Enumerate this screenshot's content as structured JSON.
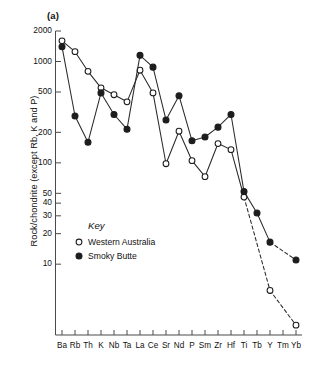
{
  "figure": {
    "panel_label": "(a)",
    "ylabel": "Rock/chondrite (except Rb, K and P)"
  },
  "legend": {
    "title": "Key",
    "entries": [
      {
        "label": "Western Australia",
        "marker": "open-circle-marker"
      },
      {
        "label": "Smoky Butte",
        "marker": "filled-circle-marker"
      }
    ]
  },
  "chart_data": {
    "type": "line",
    "title": "",
    "subtitle": "",
    "panel": "(a)",
    "xlabel": "",
    "ylabel": "Rock/chondrite (except Rb, K and P)",
    "yscale": "log",
    "ylim": [
      2.0,
      2000
    ],
    "grid": false,
    "legend_position": "inside-left",
    "ytick_labels": [
      "2000",
      "1000",
      "500",
      "200",
      "100",
      "50",
      "40",
      "30",
      "20",
      "10"
    ],
    "ytick_values": [
      2000,
      1000,
      500,
      200,
      100,
      50,
      40,
      30,
      20,
      10
    ],
    "categories": [
      "Ba",
      "Rb",
      "Th",
      "K",
      "Nb",
      "Ta",
      "La",
      "Ce",
      "Sr",
      "Nd",
      "P",
      "Sm",
      "Zr",
      "Hf",
      "Ti",
      "Tb",
      "Y",
      "Tm",
      "Yb"
    ],
    "series": [
      {
        "name": "Western Australia",
        "marker": "open-circle",
        "color": "#1d1d1d",
        "values": [
          1600,
          1250,
          800,
          550,
          470,
          400,
          820,
          490,
          98,
          205,
          105,
          73,
          155,
          135,
          46,
          null,
          5.5,
          null,
          2.5
        ],
        "dashed_from": "Ti"
      },
      {
        "name": "Smoky Butte",
        "marker": "filled-circle",
        "color": "#1d1d1d",
        "values": [
          1400,
          290,
          160,
          490,
          300,
          215,
          1150,
          880,
          265,
          460,
          165,
          180,
          225,
          300,
          52,
          32,
          16.5,
          null,
          11
        ],
        "dashed_from": "Y"
      }
    ]
  }
}
